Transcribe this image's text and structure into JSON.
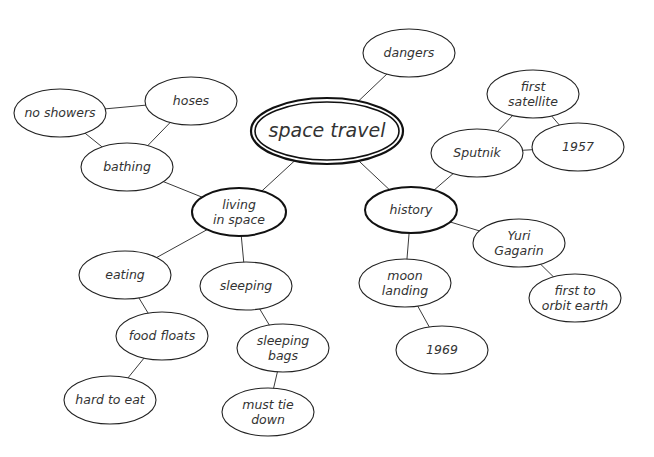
{
  "diagram": {
    "type": "mind-map",
    "central_topic": "space travel",
    "nodes": [
      {
        "id": "space_travel",
        "lines": [
          "space travel"
        ],
        "cx": 327,
        "cy": 131,
        "rx": 76,
        "ry": 33,
        "style": "double"
      },
      {
        "id": "dangers",
        "lines": [
          "dangers"
        ],
        "cx": 409,
        "cy": 53,
        "rx": 46,
        "ry": 24,
        "style": "normal"
      },
      {
        "id": "living_in_space",
        "lines": [
          "living",
          "in space"
        ],
        "cx": 239,
        "cy": 212,
        "rx": 47,
        "ry": 24,
        "style": "bold"
      },
      {
        "id": "history",
        "lines": [
          "history"
        ],
        "cx": 411,
        "cy": 210,
        "rx": 46,
        "ry": 23,
        "style": "bold"
      },
      {
        "id": "bathing",
        "lines": [
          "bathing"
        ],
        "cx": 127,
        "cy": 167,
        "rx": 46,
        "ry": 24,
        "style": "normal"
      },
      {
        "id": "no_showers",
        "lines": [
          "no showers"
        ],
        "cx": 60,
        "cy": 113,
        "rx": 46,
        "ry": 24,
        "style": "normal"
      },
      {
        "id": "hoses",
        "lines": [
          "hoses"
        ],
        "cx": 191,
        "cy": 101,
        "rx": 46,
        "ry": 24,
        "style": "normal"
      },
      {
        "id": "eating",
        "lines": [
          "eating"
        ],
        "cx": 125,
        "cy": 275,
        "rx": 46,
        "ry": 24,
        "style": "normal"
      },
      {
        "id": "food_floats",
        "lines": [
          "food floats"
        ],
        "cx": 162,
        "cy": 336,
        "rx": 46,
        "ry": 24,
        "style": "normal"
      },
      {
        "id": "hard_to_eat",
        "lines": [
          "hard to eat"
        ],
        "cx": 110,
        "cy": 400,
        "rx": 46,
        "ry": 24,
        "style": "normal"
      },
      {
        "id": "sleeping",
        "lines": [
          "sleeping"
        ],
        "cx": 246,
        "cy": 286,
        "rx": 46,
        "ry": 24,
        "style": "normal"
      },
      {
        "id": "sleeping_bags",
        "lines": [
          "sleeping",
          "bags"
        ],
        "cx": 283,
        "cy": 348,
        "rx": 46,
        "ry": 24,
        "style": "normal"
      },
      {
        "id": "must_tie_down",
        "lines": [
          "must tie",
          "down"
        ],
        "cx": 268,
        "cy": 412,
        "rx": 46,
        "ry": 24,
        "style": "normal"
      },
      {
        "id": "first_satellite",
        "lines": [
          "first",
          "satellite"
        ],
        "cx": 533,
        "cy": 94,
        "rx": 46,
        "ry": 24,
        "style": "normal"
      },
      {
        "id": "sputnik",
        "lines": [
          "Sputnik"
        ],
        "cx": 477,
        "cy": 153,
        "rx": 46,
        "ry": 24,
        "style": "normal"
      },
      {
        "id": "1957",
        "lines": [
          "1957"
        ],
        "cx": 578,
        "cy": 147,
        "rx": 46,
        "ry": 24,
        "style": "normal"
      },
      {
        "id": "yuri_gagarin",
        "lines": [
          "Yuri",
          "Gagarin"
        ],
        "cx": 519,
        "cy": 243,
        "rx": 46,
        "ry": 24,
        "style": "normal"
      },
      {
        "id": "first_to_orbit_earth",
        "lines": [
          "first to",
          "orbit earth"
        ],
        "cx": 575,
        "cy": 298,
        "rx": 46,
        "ry": 24,
        "style": "normal"
      },
      {
        "id": "moon_landing",
        "lines": [
          "moon",
          "landing"
        ],
        "cx": 405,
        "cy": 283,
        "rx": 46,
        "ry": 24,
        "style": "normal"
      },
      {
        "id": "1969",
        "lines": [
          "1969"
        ],
        "cx": 442,
        "cy": 350,
        "rx": 46,
        "ry": 24,
        "style": "normal"
      }
    ],
    "edges": [
      [
        "space_travel",
        "dangers"
      ],
      [
        "space_travel",
        "living_in_space"
      ],
      [
        "space_travel",
        "history"
      ],
      [
        "living_in_space",
        "bathing"
      ],
      [
        "bathing",
        "no_showers"
      ],
      [
        "bathing",
        "hoses"
      ],
      [
        "no_showers",
        "hoses"
      ],
      [
        "living_in_space",
        "eating"
      ],
      [
        "eating",
        "food_floats"
      ],
      [
        "food_floats",
        "hard_to_eat"
      ],
      [
        "living_in_space",
        "sleeping"
      ],
      [
        "sleeping",
        "sleeping_bags"
      ],
      [
        "sleeping_bags",
        "must_tie_down"
      ],
      [
        "history",
        "sputnik"
      ],
      [
        "sputnik",
        "first_satellite"
      ],
      [
        "sputnik",
        "1957"
      ],
      [
        "first_satellite",
        "1957"
      ],
      [
        "history",
        "yuri_gagarin"
      ],
      [
        "yuri_gagarin",
        "first_to_orbit_earth"
      ],
      [
        "history",
        "moon_landing"
      ],
      [
        "moon_landing",
        "1969"
      ]
    ]
  }
}
